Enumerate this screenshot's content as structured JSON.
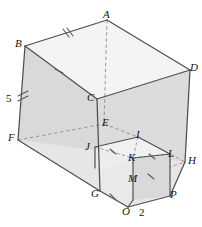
{
  "figure": {
    "type": "3d-geometry-diagram",
    "colors": {
      "outline": "#4d4d4d",
      "face_light": "#f2f2f2",
      "face_mid": "#e3e3e3",
      "face_shade": "#d7d7d7",
      "hidden_line": "#8c8c8c",
      "label": "#141414",
      "background": "#ffffff"
    },
    "vertex_labels": [
      {
        "id": "A",
        "text": "A",
        "x": 103,
        "y": 9
      },
      {
        "id": "B",
        "text": "B",
        "x": 15,
        "y": 38
      },
      {
        "id": "C",
        "text": "C",
        "x": 87,
        "y": 92
      },
      {
        "id": "D",
        "text": "D",
        "x": 190,
        "y": 62
      },
      {
        "id": "E",
        "text": "E",
        "x": 102,
        "y": 117
      },
      {
        "id": "F",
        "text": "F",
        "x": 8,
        "y": 132
      },
      {
        "id": "G",
        "text": "G",
        "x": 91,
        "y": 188
      },
      {
        "id": "H",
        "text": "H",
        "x": 188,
        "y": 155
      },
      {
        "id": "I",
        "text": "I",
        "x": 136,
        "y": 129
      },
      {
        "id": "J",
        "text": "J",
        "x": 85,
        "y": 141
      },
      {
        "id": "K",
        "text": "K",
        "x": 128,
        "y": 152
      },
      {
        "id": "L",
        "text": "L",
        "x": 168,
        "y": 148
      },
      {
        "id": "M",
        "text": "M",
        "x": 128,
        "y": 173
      },
      {
        "id": "O",
        "text": "O",
        "x": 122,
        "y": 206
      },
      {
        "id": "P",
        "text": "P",
        "x": 170,
        "y": 189
      }
    ],
    "dimension_labels": [
      {
        "id": "edge-BF",
        "text": "5",
        "x": 6,
        "y": 93
      },
      {
        "id": "edge-OP",
        "text": "2",
        "x": 139,
        "y": 207
      }
    ],
    "tick_marks": [
      {
        "edge": "B-A",
        "count": 2,
        "note": "congruence hatch on top back-left edge"
      },
      {
        "edge": "B-C",
        "count": 1,
        "note": "congruence hatch on top front-left edge"
      },
      {
        "edge": "B-F",
        "count": 2,
        "note": "congruence hatch on left vertical edge, labelled 5"
      },
      {
        "edge": "J-K",
        "count": 1,
        "note": "hatch on notch top-left edge"
      },
      {
        "edge": "K-L",
        "count": 1,
        "note": "hatch on notch top-right edge"
      },
      {
        "edge": "G-O",
        "count": 1,
        "note": "hatch on bottom front edge"
      },
      {
        "edge": "M-P",
        "count": 1,
        "note": "hatch on notch lower edge"
      }
    ]
  }
}
